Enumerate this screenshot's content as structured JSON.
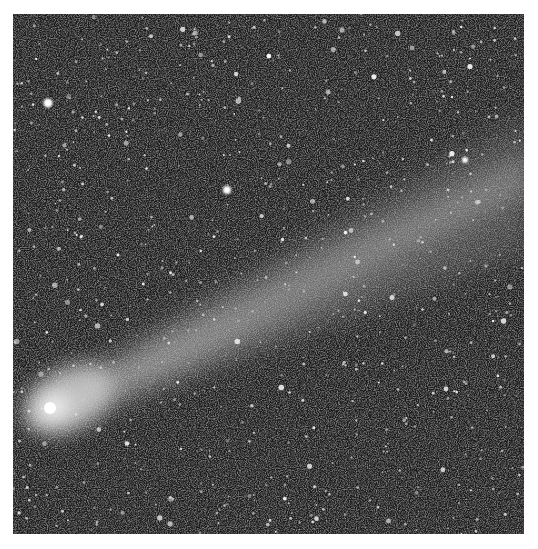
{
  "image": {
    "subject": "Comet with long ion/dust tail against a dense star field",
    "style": "grayscale astrophotograph",
    "colors": {
      "sky": "#1c1c1c",
      "noise": "#6a6a6a",
      "star": "#ffffff",
      "tail": "#9a9a9a",
      "nucleus": "#ffffff"
    },
    "elements": [
      {
        "name": "comet-nucleus",
        "location": "lower-left"
      },
      {
        "name": "comet-tail",
        "direction": "toward upper-right"
      },
      {
        "name": "bright-star",
        "location": "upper-left"
      },
      {
        "name": "bright-star",
        "location": "upper-center"
      }
    ]
  }
}
